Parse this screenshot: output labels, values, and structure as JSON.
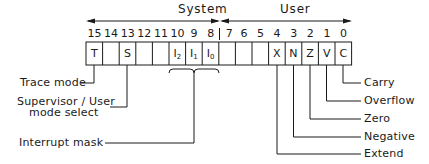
{
  "sections": {
    "system": {
      "label": "System",
      "bits": "15-8"
    },
    "user": {
      "label": "User",
      "bits": "7-0"
    }
  },
  "register": {
    "bits": [
      {
        "num": "15",
        "flag": "T"
      },
      {
        "num": "14",
        "flag": ""
      },
      {
        "num": "13",
        "flag": "S"
      },
      {
        "num": "12",
        "flag": ""
      },
      {
        "num": "11",
        "flag": ""
      },
      {
        "num": "10",
        "flag": "I",
        "sub": "2"
      },
      {
        "num": "9",
        "flag": "I",
        "sub": "1"
      },
      {
        "num": "8",
        "flag": "I",
        "sub": "0"
      },
      {
        "num": "7",
        "flag": ""
      },
      {
        "num": "6",
        "flag": ""
      },
      {
        "num": "5",
        "flag": ""
      },
      {
        "num": "4",
        "flag": "X"
      },
      {
        "num": "3",
        "flag": "N"
      },
      {
        "num": "2",
        "flag": "Z"
      },
      {
        "num": "1",
        "flag": "V"
      },
      {
        "num": "0",
        "flag": "C"
      }
    ]
  },
  "callouts_left": {
    "trace": "Trace mode",
    "supervisor_line1": "Supervisor / User",
    "supervisor_line2": "mode select",
    "interrupt": "Interrupt mask"
  },
  "callouts_right": {
    "carry": "Carry",
    "overflow": "Overflow",
    "zero": "Zero",
    "negative": "Negative",
    "extend": "Extend"
  },
  "colors": {
    "ink": "#1a1a1a",
    "background": "#ffffff"
  }
}
